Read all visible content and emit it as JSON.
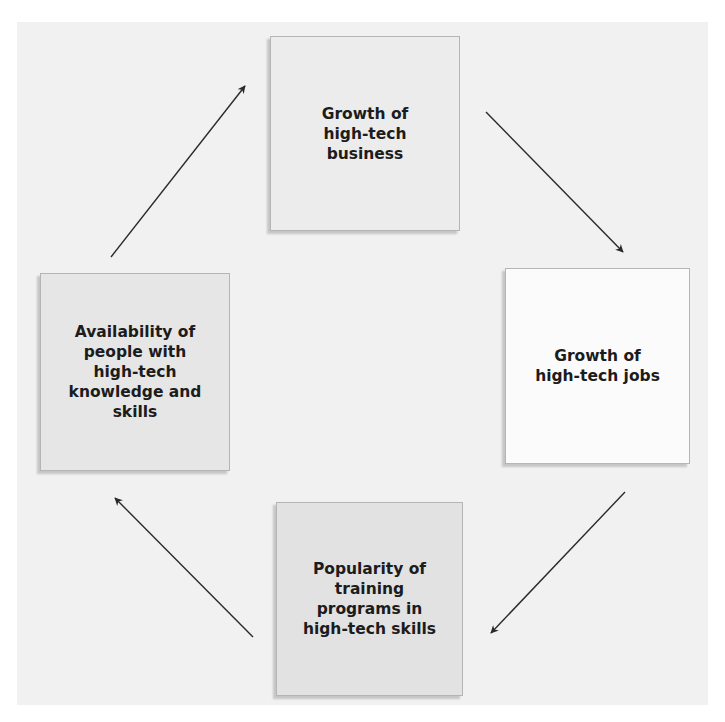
{
  "diagram": {
    "type": "cycle",
    "background_color": "#f1f1f1",
    "nodes": [
      {
        "id": "top",
        "lines": [
          "Growth of",
          "high-tech",
          "business"
        ],
        "fill": "#ececec"
      },
      {
        "id": "right",
        "lines": [
          "Growth of",
          "high-tech jobs"
        ],
        "fill": "#fbfbfb"
      },
      {
        "id": "bottom",
        "lines": [
          "Popularity of",
          "training",
          "programs in",
          "high-tech skills"
        ],
        "fill": "#e2e2e2"
      },
      {
        "id": "left",
        "lines": [
          "Availability of",
          "people with",
          "high-tech",
          "knowledge and",
          "skills"
        ],
        "fill": "#e6e6e6"
      }
    ],
    "edges": [
      {
        "from": "top",
        "to": "right",
        "x1": 486,
        "y1": 112,
        "x2": 623,
        "y2": 252
      },
      {
        "from": "right",
        "to": "bottom",
        "x1": 625,
        "y1": 492,
        "x2": 491,
        "y2": 633
      },
      {
        "from": "bottom",
        "to": "left",
        "x1": 253,
        "y1": 637,
        "x2": 115,
        "y2": 498
      },
      {
        "from": "left",
        "to": "top",
        "x1": 111,
        "y1": 257,
        "x2": 245,
        "y2": 86
      }
    ],
    "arrow_color": "#2a2a2a"
  }
}
